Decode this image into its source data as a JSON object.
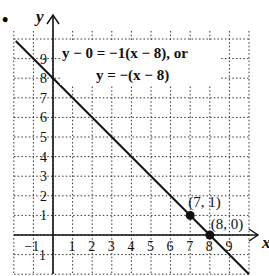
{
  "problem_marker": "•",
  "chart_data": {
    "type": "line",
    "title": "",
    "xlabel": "x",
    "ylabel": "y",
    "xlim": [
      -2,
      10
    ],
    "ylim": [
      -2,
      10
    ],
    "grid": true,
    "grid_style": "dotted",
    "x_ticks": [
      "−1",
      "1",
      "2",
      "3",
      "4",
      "5",
      "6",
      "7",
      "8",
      "9"
    ],
    "y_ticks": [
      "−1",
      "1",
      "2",
      "3",
      "4",
      "5",
      "6",
      "7",
      "8",
      "9"
    ],
    "series": [
      {
        "name": "y = −(x − 8)",
        "slope": -1,
        "intercept": 8,
        "x": [
          -1.9,
          10
        ],
        "y": [
          9.9,
          -2
        ]
      }
    ],
    "points": [
      {
        "x": 7,
        "y": 1,
        "label": "(7, 1)"
      },
      {
        "x": 8,
        "y": 0,
        "label": "(8, 0)"
      }
    ],
    "annotations": [
      {
        "text": "y − 0 = −1(x − 8), or"
      },
      {
        "text": "y = −(x − 8)"
      }
    ]
  }
}
